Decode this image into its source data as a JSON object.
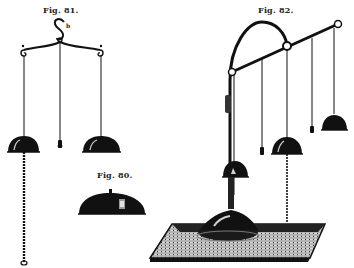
{
  "figures": [
    {
      "id": "fig81",
      "label": "Fig. 81.",
      "hook_label": "b",
      "description": "Hanging triple pendulum with two lamp shades and central weight"
    },
    {
      "id": "fig80",
      "label": "Fig. 80.",
      "description": "Single bell-shaped shade"
    },
    {
      "id": "fig82",
      "label": "Fig. 82.",
      "description": "Standing arm apparatus on base with hanging shades and weights"
    }
  ],
  "colors": {
    "ink": "#111111",
    "paper": "#ffffff",
    "shade_highlight": "#cfcfcf",
    "base_texture": "#8a8a8a"
  }
}
